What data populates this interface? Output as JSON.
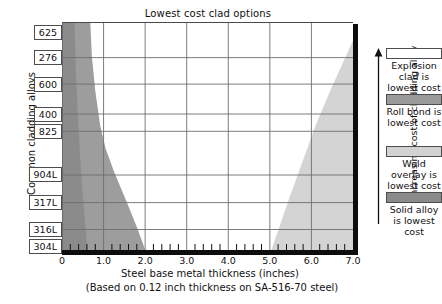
{
  "chart_data": {
    "type": "area",
    "title": "Lowest cost clad options",
    "xlabel": "Steel base metal thickness (inches)",
    "sublabel": "(Based on 0.12 inch thickness on SA-516-70 steel)",
    "ylabel": "Common cladding alloys",
    "legend_axis_label": "Increasing cost of cladding alloy",
    "xlim": [
      0,
      7.0
    ],
    "xticks": [
      "0",
      "1.0",
      "2.0",
      "3.0",
      "4.0",
      "5.0",
      "6.0",
      "7.0"
    ],
    "xtick_values": [
      0,
      1.0,
      2.0,
      3.0,
      4.0,
      5.0,
      6.0,
      7.0
    ],
    "minor_ticks_per_interval": 5,
    "grid": "major-vertical-and-horizontal",
    "ycategories": [
      "625",
      "276",
      "600",
      "400",
      "825",
      "904L",
      "317L",
      "316L",
      "304L"
    ],
    "ycategory_positions": [
      0.955,
      0.845,
      0.73,
      0.6,
      0.525,
      0.335,
      0.215,
      0.098,
      0.025
    ],
    "legend": {
      "position": "right",
      "entries": [
        {
          "label": "Explosion clad is lowest cost",
          "color": "#ffffff",
          "region": "explosion"
        },
        {
          "label": "Roll bond is lowest cost",
          "color": "#9a9a9a",
          "region": "roll-bond"
        },
        {
          "label": "Weld overlay is lowest cost",
          "color": "#d2d2d2",
          "region": "weld-overlay"
        },
        {
          "label": "Solid alloy is lowest cost",
          "color": "#8a8a8a",
          "region": "solid-alloy"
        }
      ]
    },
    "series": [
      {
        "name": "Solid alloy is lowest cost",
        "color": "#8a8a8a",
        "description": "Narrow band along the left edge, widest at top, tapering toward bottom-left.",
        "boundary_x_by_y": [
          {
            "y": 1.0,
            "x": 0.3
          },
          {
            "y": 0.8,
            "x": 0.33
          },
          {
            "y": 0.6,
            "x": 0.38
          },
          {
            "y": 0.4,
            "x": 0.44
          },
          {
            "y": 0.2,
            "x": 0.52
          },
          {
            "y": 0.0,
            "x": 0.62
          }
        ]
      },
      {
        "name": "Roll bond is lowest cost",
        "color": "#9a9a9a",
        "description": "Left wedge between solid-alloy band and the white explosion-clad region; widens downward from about 0.65 in at the top to 2.0 in at the bottom axis.",
        "boundary_x_by_y": [
          {
            "y": 1.0,
            "x": 0.68
          },
          {
            "y": 0.85,
            "x": 0.72
          },
          {
            "y": 0.7,
            "x": 0.8
          },
          {
            "y": 0.55,
            "x": 0.92
          },
          {
            "y": 0.45,
            "x": 1.05
          },
          {
            "y": 0.35,
            "x": 1.25
          },
          {
            "y": 0.22,
            "x": 1.55
          },
          {
            "y": 0.1,
            "x": 1.82
          },
          {
            "y": 0.0,
            "x": 2.02
          }
        ]
      },
      {
        "name": "Weld overlay is lowest cost",
        "color": "#d2d2d2",
        "description": "Right wedge rising from about 5.0 in at the bottom axis to about 6.4 in at the top-right corner region.",
        "boundary_x_by_y": [
          {
            "y": 0.0,
            "x": 5.02
          },
          {
            "y": 0.12,
            "x": 5.25
          },
          {
            "y": 0.25,
            "x": 5.5
          },
          {
            "y": 0.4,
            "x": 5.8
          },
          {
            "y": 0.55,
            "x": 6.1
          },
          {
            "y": 0.7,
            "x": 6.45
          },
          {
            "y": 0.82,
            "x": 6.75
          },
          {
            "y": 0.92,
            "x": 7.0
          }
        ]
      },
      {
        "name": "Explosion clad is lowest cost",
        "color": "#ffffff",
        "description": "Large central white region between the roll-bond wedge on the left and the weld-overlay wedge on the right."
      }
    ]
  }
}
